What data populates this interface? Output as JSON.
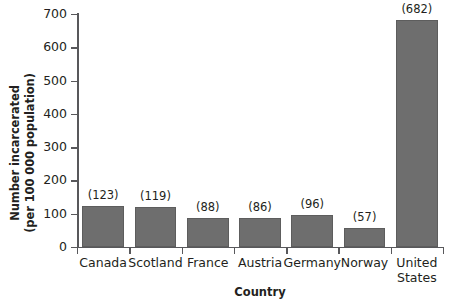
{
  "chart_data": {
    "type": "bar",
    "title": "",
    "categories": [
      "Canada",
      "Scotland",
      "France",
      "Austria",
      "Germany",
      "Norway",
      "United States"
    ],
    "values": [
      123,
      119,
      88,
      86,
      96,
      57,
      682
    ],
    "point_labels": [
      "(123)",
      "(119)",
      "(88)",
      "(86)",
      "(96)",
      "(57)",
      "(682)"
    ],
    "xlabel": "Country",
    "ylabel": "Number incarcerated (per 100 000 population)",
    "ylabel_lines": [
      "Number incarcerated",
      "(per 100 000 population)"
    ],
    "ylim": [
      0,
      700
    ],
    "ytick_step": 100,
    "yticks": [
      0,
      100,
      200,
      300,
      400,
      500,
      600,
      700
    ],
    "ytick_labels": [
      "0",
      "100",
      "200",
      "300",
      "400",
      "500",
      "600",
      "700"
    ],
    "grid": false,
    "legend": false,
    "bar_color": "#6e6e6e",
    "bar_edge_color": "#5d5d5d",
    "axis_color": "#58585b",
    "background_color": "#ffffff",
    "text_color": "#231f20"
  }
}
